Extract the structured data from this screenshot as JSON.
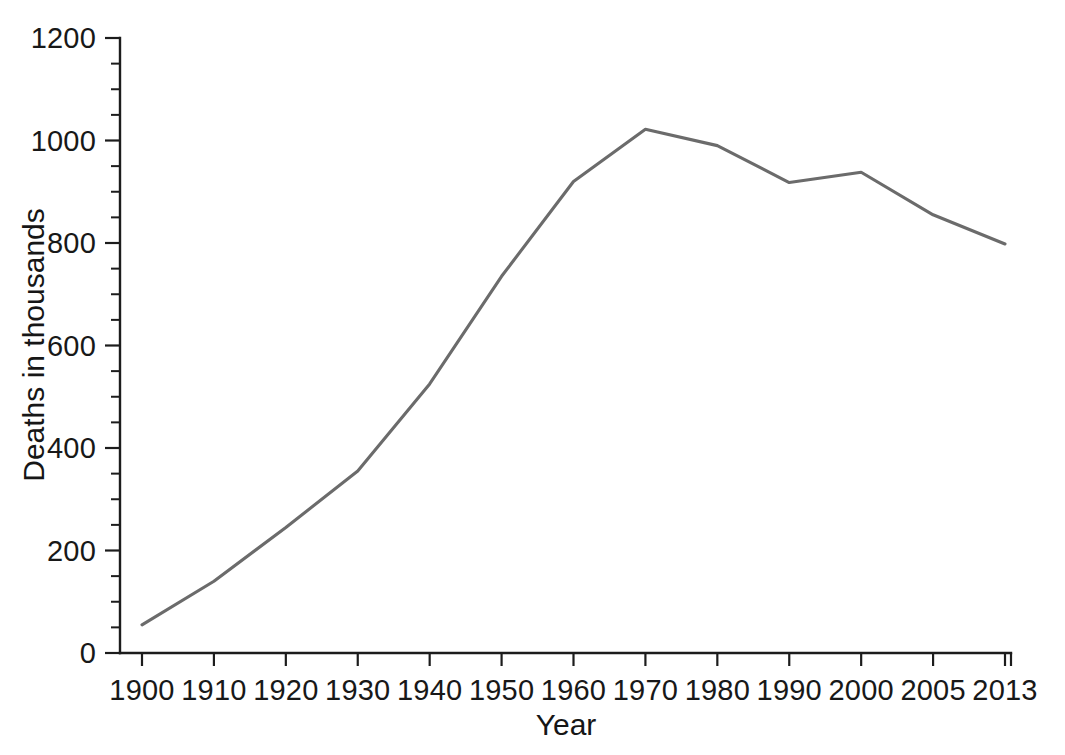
{
  "chart_data": {
    "type": "line",
    "title": "",
    "subtitle": "",
    "xlabel": "Year",
    "ylabel": "Deaths in thousands",
    "categories": [
      "1900",
      "1910",
      "1920",
      "1930",
      "1940",
      "1950",
      "1960",
      "1970",
      "1980",
      "1990",
      "2000",
      "2005",
      "2013"
    ],
    "values": [
      55,
      140,
      245,
      355,
      525,
      735,
      920,
      1022,
      990,
      918,
      938,
      855,
      798
    ],
    "series": [
      {
        "name": "Deaths in thousands",
        "values": [
          55,
          140,
          245,
          355,
          525,
          735,
          920,
          1022,
          990,
          918,
          938,
          855,
          798
        ],
        "color": "#6b6b6b"
      }
    ],
    "ylim": [
      0,
      1200
    ],
    "y_ticks": [
      "0",
      "200",
      "400",
      "600",
      "800",
      "1000",
      "1200"
    ],
    "y_tick_values": [
      0,
      200,
      400,
      600,
      800,
      1000,
      1200
    ],
    "y_minor_step": 50,
    "x_ticks": [
      "1900",
      "1910",
      "1920",
      "1930",
      "1940",
      "1950",
      "1960",
      "1970",
      "1980",
      "1990",
      "2000",
      "2005",
      "2013"
    ],
    "x_axis_scale": "categorical",
    "grid": false,
    "legend": false,
    "legend_position": "none",
    "annotations": [],
    "axis_color": "#1c1c1c",
    "line_color": "#6b6b6b",
    "background_color": "#ffffff"
  },
  "axis": {
    "y_label_text": "Deaths in thousands",
    "x_label_text": "Year"
  }
}
